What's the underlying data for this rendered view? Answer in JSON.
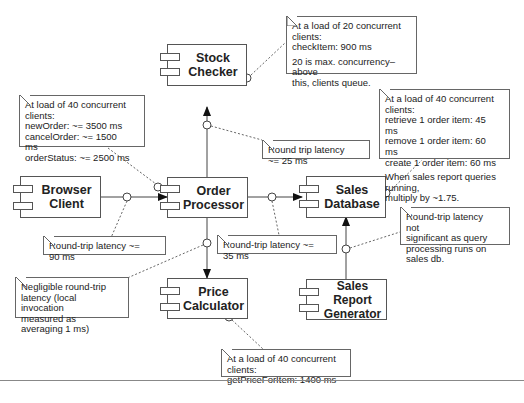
{
  "components": {
    "stock_checker": {
      "line1": "Stock",
      "line2": "Checker"
    },
    "browser_client": {
      "line1": "Browser",
      "line2": "Client"
    },
    "order_processor": {
      "line1": "Order",
      "line2": "Processor"
    },
    "sales_database": {
      "line1": "Sales",
      "line2": "Database"
    },
    "price_calculator": {
      "line1": "Price",
      "line2": "Calculator"
    },
    "sales_report_generator": {
      "line1": "Sales Report",
      "line2": "Generator"
    }
  },
  "notes": {
    "stock_checker_load": {
      "lines": [
        "At a load of 20 concurrent clients:",
        "checkItem: 900 ms"
      ],
      "extra": [
        "20 is max. concurrency–above",
        "this, clients queue."
      ]
    },
    "order_processor_load": {
      "lines": [
        "At load of 40 concurrent clients:",
        "newOrder:  ~= 3500 ms",
        "cancelOrder: ~= 1500  ms",
        "orderStatus: ~= 2500 ms"
      ]
    },
    "sales_database_load": {
      "lines": [
        "At a load of 40 concurrent clients:",
        "retrieve 1 order item: 45 ms",
        "remove 1 order item: 60 ms",
        "create 1 order item: 60 ms"
      ],
      "extra": [
        "When sales report queries running,",
        "multiply by ~1.75."
      ]
    },
    "stock_latency": {
      "text": "Round trip latency ~= 25 ms"
    },
    "browser_latency": {
      "text": "Round-trip latency ~= 90 ms"
    },
    "database_latency": {
      "text": "Round-trip latency ~= 35 ms"
    },
    "price_latency": {
      "lines": [
        "Negligible round-trip",
        "latency (local invocation",
        "measured as averaging 1 ms)"
      ]
    },
    "report_latency": {
      "lines": [
        "Round-trip latency not",
        "significant as query",
        "processing runs on sales db."
      ]
    },
    "price_calculator_load": {
      "lines": [
        "At a load of 40 concurrent clients:",
        "getPriceForItem: 1400 ms"
      ]
    }
  }
}
